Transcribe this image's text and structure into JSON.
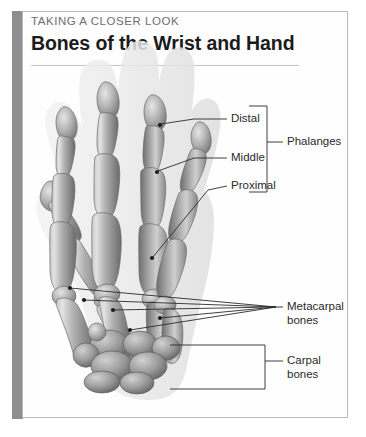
{
  "figure": {
    "kicker": "TAKING A CLOSER LOOK",
    "title": "Bones of the Wrist and Hand",
    "accent_color": "#8e8e8e",
    "frame_border_color": "#b9b9b9",
    "background_color": "#ffffff",
    "illustration": {
      "subject": "human left hand skeleton, dorsal view",
      "bone_fill_light": "#d8d8d8",
      "bone_fill_mid": "#a8a8a8",
      "bone_fill_dark": "#6f6f6f",
      "soft_tissue_halo": "#ededed"
    }
  },
  "labels": [
    {
      "id": "distal",
      "text": "Distal",
      "leader": "line"
    },
    {
      "id": "middle",
      "text": "Middle",
      "leader": "line"
    },
    {
      "id": "proximal",
      "text": "Proximal",
      "leader": "line"
    },
    {
      "id": "phalanges",
      "text": "Phalanges",
      "leader": "bracket"
    },
    {
      "id": "metacarpal-bones",
      "text_line_1": "Metacarpal",
      "text_line_2": "bones",
      "leader": "fan"
    },
    {
      "id": "carpal-bones",
      "text_line_1": "Carpal",
      "text_line_2": "bones",
      "leader": "bracket"
    }
  ],
  "anatomy_groups": {
    "phalanges": [
      "Distal",
      "Middle",
      "Proximal"
    ],
    "metacarpal_count": 5,
    "carpal_count": 8
  }
}
